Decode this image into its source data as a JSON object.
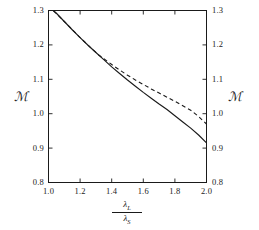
{
  "figure": {
    "background": "#ffffff",
    "line_color": "#1a1a1a",
    "axis_color": "#1a1a1a",
    "y_axis_label_left": "ℳ",
    "y_axis_label_right": "ℳ",
    "x_axis_numerator": "λ",
    "x_axis_numerator_sub": "L",
    "x_axis_denominator": "λ",
    "x_axis_denominator_sub": "S"
  },
  "axes": {
    "x_ticks": [
      "1.0",
      "1.2",
      "1.4",
      "1.6",
      "1.8",
      "2.0"
    ],
    "y_ticks": [
      "0.8",
      "0.9",
      "1.0",
      "1.1",
      "1.2",
      "1.3"
    ],
    "y_ticks_right": [
      "0.8",
      "0.9",
      "1.0",
      "1.1",
      "1.2",
      "1.3"
    ]
  },
  "chart_data": {
    "type": "line",
    "title": "",
    "xlabel": "λ_L / λ_S",
    "ylabel": "ℳ",
    "xlim": [
      1.0,
      2.0
    ],
    "ylim": [
      0.8,
      1.3
    ],
    "xticks": [
      1.0,
      1.2,
      1.4,
      1.6,
      1.8,
      2.0
    ],
    "yticks": [
      0.8,
      0.9,
      1.0,
      1.1,
      1.2,
      1.3
    ],
    "grid": false,
    "legend": null,
    "series": [
      {
        "name": "solid",
        "style": "solid",
        "color": "#1a1a1a",
        "x": [
          1.03,
          1.05,
          1.1,
          1.15,
          1.2,
          1.25,
          1.3,
          1.35,
          1.4,
          1.45,
          1.5,
          1.55,
          1.6,
          1.65,
          1.7,
          1.75,
          1.8,
          1.85,
          1.9,
          1.95,
          2.0
        ],
        "y": [
          1.3,
          1.292,
          1.268,
          1.244,
          1.221,
          1.199,
          1.178,
          1.157,
          1.136,
          1.117,
          1.098,
          1.08,
          1.062,
          1.045,
          1.028,
          1.012,
          0.994,
          0.976,
          0.958,
          0.938,
          0.915
        ]
      },
      {
        "name": "dashed",
        "style": "dashed",
        "color": "#1a1a1a",
        "x": [
          1.03,
          1.1,
          1.2,
          1.3,
          1.32,
          1.35,
          1.4,
          1.45,
          1.5,
          1.55,
          1.6,
          1.65,
          1.7,
          1.75,
          1.8,
          1.85,
          1.9,
          1.95,
          2.0
        ],
        "y": [
          1.3,
          1.268,
          1.221,
          1.178,
          1.17,
          1.16,
          1.143,
          1.127,
          1.112,
          1.098,
          1.085,
          1.072,
          1.06,
          1.048,
          1.036,
          1.023,
          1.01,
          0.992,
          0.97
        ]
      }
    ]
  }
}
